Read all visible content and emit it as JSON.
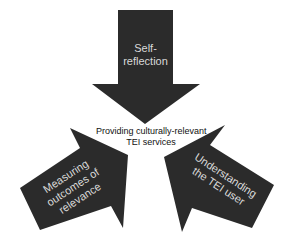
{
  "diagram": {
    "center": {
      "line1": "Providing culturally-relevant",
      "line2": "TEI services"
    },
    "arrows": [
      {
        "id": "top",
        "line1": "Self-",
        "line2": "reflection",
        "direction": "down"
      },
      {
        "id": "left",
        "line1": "Measuring",
        "line2": "outcomes of",
        "line3": "relevance",
        "direction": "up-right"
      },
      {
        "id": "right",
        "line1": "Understanding",
        "line2": "the TEI user",
        "direction": "up-left"
      }
    ],
    "colors": {
      "arrow_fill": "#2b2b2b",
      "arrow_text": "#d9d9d9",
      "center_text": "#111111",
      "background": "#ffffff"
    }
  }
}
